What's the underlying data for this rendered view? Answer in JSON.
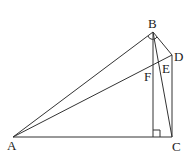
{
  "diagram": {
    "type": "geometry",
    "points": {
      "A": {
        "label": "A",
        "x": 13,
        "y": 137
      },
      "B": {
        "label": "B",
        "x": 153,
        "y": 32
      },
      "C": {
        "label": "C",
        "x": 172,
        "y": 137
      },
      "D": {
        "label": "D",
        "x": 172,
        "y": 55
      },
      "E": {
        "label": "E",
        "x": 162,
        "y": 63
      },
      "F": {
        "label": "F",
        "x": 153,
        "y": 68
      },
      "H": {
        "label": "",
        "x": 153,
        "y": 137
      }
    },
    "segments": [
      "AB",
      "AC",
      "AD",
      "BC",
      "BD",
      "CD",
      "BH"
    ],
    "right_angle_markers": [
      "BHC"
    ],
    "angle_arcs": [
      "ABD"
    ],
    "colors": {
      "line": "#333333",
      "background": "#ffffff"
    }
  }
}
